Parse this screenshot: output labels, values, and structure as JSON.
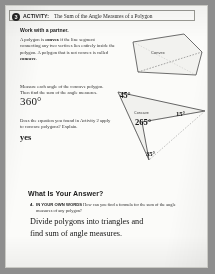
{
  "page": {
    "background_color": "#8e8e8e",
    "sheet_color": "#fbfbf9"
  },
  "activity": {
    "number": "3",
    "label": "ACTIVITY:",
    "title": "The Sum of the Angle Measures of a Polygon"
  },
  "instructions": {
    "work_with_partner": "Work with a partner.",
    "definition_line1": "A polygon is ",
    "definition_bold1": "convex",
    "definition_line1b": " if the line segment connecting",
    "definition_line2": "any two vertices lies entirely inside the polygon.",
    "definition_line3": "A polygon that is not convex is called ",
    "definition_bold2": "concave",
    "definition_line3b": ".",
    "measure_prompt_line1": "Measure each angle of the concave polygon.",
    "measure_prompt_line2": "Then find the sum of the angle measures.",
    "apply_prompt_line1": "Does the equation you found in Activity 2",
    "apply_prompt_line2": "apply to concave polygons? Explain."
  },
  "answers": {
    "angle_sum": "360°",
    "applies_to_concave": "yes",
    "final_line1": "Divide polygons into triangles and",
    "final_line2": "find sum of angle measures."
  },
  "diagrams": {
    "convex": {
      "shape_label": "Convex",
      "type": "quadrilateral",
      "has_dashed_diagonal": true
    },
    "concave": {
      "shape_label": "Concave",
      "type": "dart-quadrilateral",
      "has_dashed_construction": true,
      "angles": [
        {
          "name": "angle-45",
          "value": "45°"
        },
        {
          "name": "angle-15",
          "value": "15°"
        },
        {
          "name": "angle-265",
          "value": "265°"
        },
        {
          "name": "angle-35",
          "value": "35°"
        }
      ]
    }
  },
  "what_is_your_answer": {
    "heading": "What Is Your Answer?",
    "question_number": "4.",
    "question_caps": "IN YOUR OWN WORDS",
    "question_text": " How can you find a formula for the sum of the angle measures of any polygon?"
  }
}
